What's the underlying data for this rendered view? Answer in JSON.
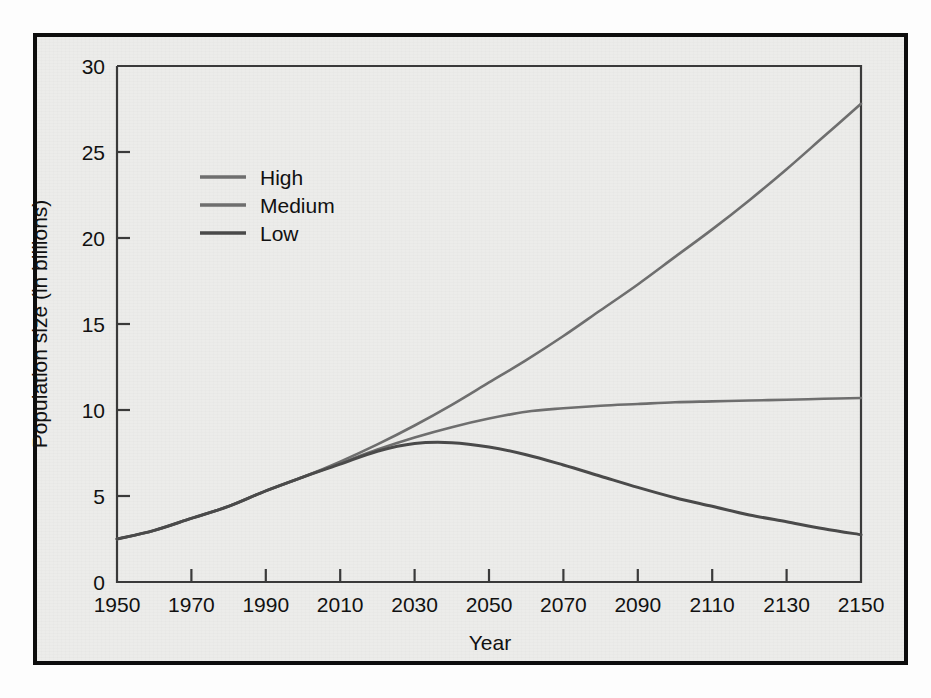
{
  "figure": {
    "background_color": "#ececea",
    "frame_color": "#0d0d0d",
    "axis_color": "#3a3a3a"
  },
  "chart_data": {
    "type": "line",
    "title": "",
    "xlabel": "Year",
    "ylabel": "Population size (in billions)",
    "xlim": [
      1950,
      2150
    ],
    "ylim": [
      0,
      30
    ],
    "xticks": [
      1950,
      1970,
      1990,
      2010,
      2030,
      2050,
      2070,
      2090,
      2110,
      2130,
      2150
    ],
    "yticks": [
      0,
      5,
      10,
      15,
      20,
      25,
      30
    ],
    "grid": false,
    "legend_position": "upper-left-inside",
    "x": [
      1950,
      1960,
      1970,
      1980,
      1990,
      2000,
      2010,
      2020,
      2030,
      2040,
      2050,
      2060,
      2070,
      2080,
      2090,
      2100,
      2110,
      2120,
      2130,
      2140,
      2150
    ],
    "series": [
      {
        "name": "High",
        "color": "#6e6e6e",
        "line_width": 2.6,
        "values": [
          2.5,
          3.0,
          3.7,
          4.4,
          5.3,
          6.1,
          7.0,
          8.0,
          9.1,
          10.3,
          11.6,
          12.9,
          14.3,
          15.8,
          17.3,
          18.9,
          20.5,
          22.2,
          24.0,
          25.9,
          27.8
        ]
      },
      {
        "name": "Medium",
        "color": "#6e6e6e",
        "line_width": 2.6,
        "values": [
          2.5,
          3.0,
          3.7,
          4.4,
          5.3,
          6.1,
          6.9,
          7.7,
          8.4,
          9.0,
          9.5,
          9.9,
          10.1,
          10.25,
          10.35,
          10.45,
          10.5,
          10.55,
          10.6,
          10.65,
          10.7
        ]
      },
      {
        "name": "Low",
        "color": "#4a4a4a",
        "line_width": 3.0,
        "values": [
          2.5,
          3.0,
          3.7,
          4.4,
          5.3,
          6.1,
          6.85,
          7.6,
          8.05,
          8.1,
          7.85,
          7.4,
          6.8,
          6.15,
          5.5,
          4.9,
          4.4,
          3.9,
          3.5,
          3.1,
          2.75
        ]
      }
    ]
  },
  "legend": {
    "items": [
      {
        "label": "High",
        "color": "#6e6e6e"
      },
      {
        "label": "Medium",
        "color": "#6e6e6e"
      },
      {
        "label": "Low",
        "color": "#4a4a4a"
      }
    ]
  }
}
